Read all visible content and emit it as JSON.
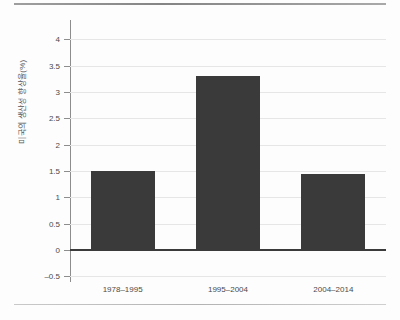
{
  "chart_data": {
    "type": "bar",
    "title": "",
    "subtitle": "",
    "xlabel": "",
    "ylabel": "미국의 생산성 향상율(%)",
    "categories": [
      "1978-1995",
      "1995-2004",
      "2004-2014"
    ],
    "values": [
      1.5,
      3.3,
      1.45
    ],
    "series": [
      {
        "name": "미국의 생산성 향상율(%)",
        "values": [
          1.5,
          3.3,
          1.45
        ]
      }
    ],
    "ylim": [
      -0.5,
      4.25
    ],
    "yticks": [
      4,
      3.5,
      3,
      2.5,
      2,
      1.5,
      1,
      0.5,
      0,
      -0.5
    ],
    "ytick_labels": [
      "4",
      "3.5",
      "3",
      "2.5",
      "2",
      "1.5",
      "1",
      "0.5",
      "0",
      "-0.5"
    ],
    "grid": true,
    "grid_axis": "y",
    "legend": false,
    "legend_position": "none",
    "bar_color": "#3a3a3a",
    "gridline_color": "#e6e6e6",
    "axis_color": "#8d8d8d",
    "zero_line_color": "#3b3b3b",
    "background_color": "#fdfdfd",
    "annotations": []
  }
}
